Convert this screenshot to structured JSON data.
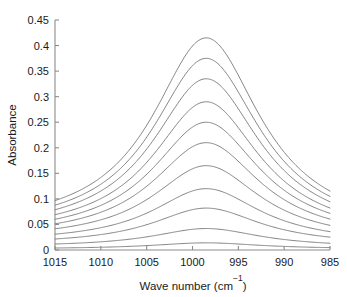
{
  "chart_data": {
    "type": "line",
    "title": "",
    "xlabel": "Wave number (cm−1)",
    "ylabel": "Absorbance",
    "xlabel_base": "Wave number (cm",
    "xlabel_sup": "−1",
    "xlabel_close": ")",
    "xlim": [
      1015,
      985
    ],
    "ylim": [
      0,
      0.45
    ],
    "x_reversed": true,
    "grid": false,
    "legend": "none",
    "xticks": [
      1015,
      1010,
      1005,
      1000,
      995,
      990,
      985
    ],
    "xtick_labels": [
      "1015",
      "1010",
      "1005",
      "1000",
      "995",
      "990",
      "985"
    ],
    "yticks": [
      0,
      0.05,
      0.1,
      0.15,
      0.2,
      0.25,
      0.3,
      0.35,
      0.4,
      0.45
    ],
    "ytick_labels": [
      "0",
      "0.05",
      "0.1",
      "0.15",
      "0.2",
      "0.25",
      "0.3",
      "0.35",
      "0.4",
      "0.45"
    ],
    "peak_center": 998.5,
    "peak_halfwidth": 7.2,
    "line_color": "#6e6e6e",
    "axis_color": "#8c8c8c",
    "text_color": "#1a1a1a",
    "background": "#ffffff",
    "series": [
      {
        "name": "curve-1",
        "peak_value": 0.415,
        "baseline_left": 0.036,
        "baseline_right": 0.03
      },
      {
        "name": "curve-2",
        "peak_value": 0.375,
        "baseline_left": 0.033,
        "baseline_right": 0.028
      },
      {
        "name": "curve-3",
        "peak_value": 0.335,
        "baseline_left": 0.03,
        "baseline_right": 0.026
      },
      {
        "name": "curve-4",
        "peak_value": 0.29,
        "baseline_left": 0.027,
        "baseline_right": 0.023
      },
      {
        "name": "curve-5",
        "peak_value": 0.25,
        "baseline_left": 0.024,
        "baseline_right": 0.021
      },
      {
        "name": "curve-6",
        "peak_value": 0.21,
        "baseline_left": 0.021,
        "baseline_right": 0.018
      },
      {
        "name": "curve-7",
        "peak_value": 0.165,
        "baseline_left": 0.018,
        "baseline_right": 0.015
      },
      {
        "name": "curve-8",
        "peak_value": 0.12,
        "baseline_left": 0.014,
        "baseline_right": 0.012
      },
      {
        "name": "curve-9",
        "peak_value": 0.082,
        "baseline_left": 0.01,
        "baseline_right": 0.009
      },
      {
        "name": "curve-10",
        "peak_value": 0.042,
        "baseline_left": 0.006,
        "baseline_right": 0.005
      },
      {
        "name": "curve-11",
        "peak_value": 0.014,
        "baseline_left": 0.002,
        "baseline_right": 0.002
      }
    ]
  }
}
